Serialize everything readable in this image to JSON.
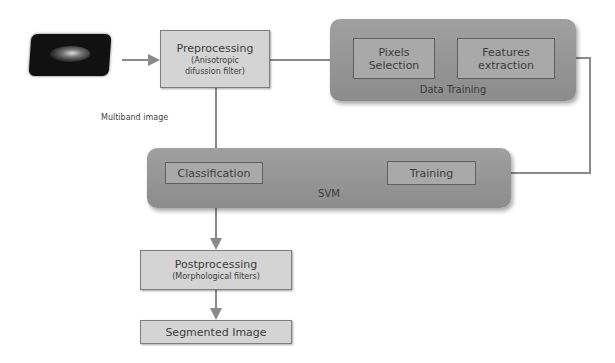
{
  "diagram": {
    "source_image": {
      "icon": "multiband-image-thumbnail"
    },
    "multiband_label": "Multiband image",
    "preprocessing": {
      "title": "Preprocessing",
      "subtitle_line1": "(Anisotropic",
      "subtitle_line2": "difussion filter)"
    },
    "data_training": {
      "label": "Data Training",
      "pixels_selection": {
        "line1": "Pixels",
        "line2": "Selection"
      },
      "features_extraction": {
        "line1": "Features",
        "line2": "extraction"
      }
    },
    "svm": {
      "label": "SVM",
      "classification": "Classification",
      "training": "Training"
    },
    "postprocessing": {
      "title": "Postprocessing",
      "subtitle": "(Morphological filters)"
    },
    "segmented_image": "Segmented Image",
    "colors": {
      "box_fill": "#d4d4d4",
      "group_fill": "#959595",
      "inner_fill": "#a9a9a9",
      "line": "#8a8a8a",
      "text": "#3c3c3c"
    }
  }
}
